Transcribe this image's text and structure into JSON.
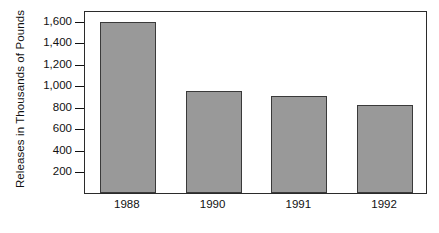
{
  "chart_data": {
    "type": "bar",
    "title": "",
    "xlabel": "",
    "ylabel": "Releases in Thousands of Pounds",
    "categories": [
      "1988",
      "1990",
      "1991",
      "1992"
    ],
    "values": [
      1590,
      950,
      900,
      820
    ],
    "ylim": [
      0,
      1700
    ],
    "yticks": [
      200,
      400,
      600,
      800,
      1000,
      1200,
      1400,
      1600
    ],
    "ytick_labels": [
      "200",
      "400",
      "600",
      "800",
      "1,000",
      "1,200",
      "1,400",
      "1,600"
    ],
    "grid": false,
    "legend": null,
    "bar_color": "#999999",
    "bar_edge_color": "#3a3a3a",
    "frame_color": "#2b2b2b",
    "background_color": "#ffffff",
    "text_color": "#111111"
  }
}
